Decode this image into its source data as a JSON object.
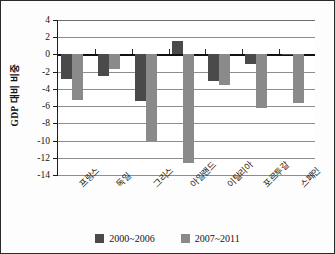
{
  "chart_data": {
    "type": "bar",
    "title": "",
    "xlabel": "",
    "ylabel": "GDP 대비 비중",
    "ylim": [
      -14,
      4
    ],
    "yticks": [
      4,
      2,
      0,
      -2,
      -4,
      -6,
      -8,
      -10,
      -12,
      -14
    ],
    "ytick_labels": [
      "4",
      "2",
      "0",
      "-2",
      "-4",
      "-6",
      "-8",
      "-10",
      "-12",
      "-14"
    ],
    "grid": true,
    "legend_position": "bottom-center",
    "categories": [
      "프랑스",
      "독일",
      "그리스",
      "아일랜드",
      "이탈리아",
      "포르투갈",
      "스페인"
    ],
    "series": [
      {
        "name": "2000~2006",
        "color": "#4a4a4a",
        "values": [
          -2.8,
          -2.5,
          -5.4,
          1.6,
          -3.1,
          -1.1,
          -0.05
        ]
      },
      {
        "name": "2007~2011",
        "color": "#8a8a8a",
        "values": [
          -5.3,
          -1.7,
          -10.0,
          -12.6,
          -3.5,
          -6.2,
          -5.6
        ]
      }
    ]
  },
  "legend": {
    "items": [
      {
        "label": "2000~2006",
        "color": "#4a4a4a"
      },
      {
        "label": "2007~2011",
        "color": "#8a8a8a"
      }
    ]
  }
}
